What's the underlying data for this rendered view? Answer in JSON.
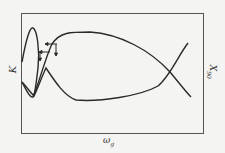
{
  "figure": {
    "y_label_left": "K",
    "y_label_right": "X",
    "y_label_right_sub": "90",
    "x_label": "ω",
    "x_label_sub": "g"
  },
  "colors": {
    "background": "#f4f4f2",
    "line": "#2a2a2a",
    "frame": "#555555"
  }
}
